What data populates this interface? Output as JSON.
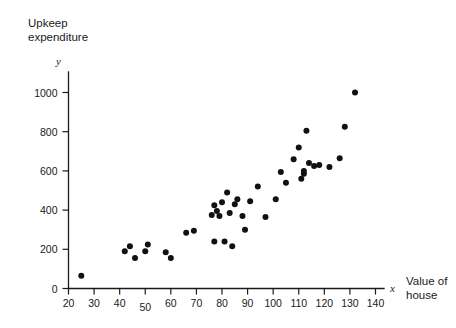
{
  "chart_data": {
    "type": "scatter",
    "title": "",
    "ylabel": "Upkeep expenditure",
    "ylabel_lines": [
      "Upkeep",
      "expenditure"
    ],
    "xlabel": "Value of house",
    "xlabel_lines": [
      "Value of",
      "house"
    ],
    "x_var_symbol": "x",
    "y_var_symbol": "y",
    "xlim": [
      20,
      145
    ],
    "ylim": [
      0,
      1060
    ],
    "x_ticks": [
      20,
      30,
      40,
      50,
      60,
      70,
      80,
      90,
      100,
      110,
      120,
      130,
      140
    ],
    "y_ticks": [
      0,
      200,
      400,
      600,
      800,
      1000
    ],
    "grid": false,
    "legend": null,
    "marker": "filled-circle",
    "marker_color": "#111111",
    "marker_radius": 3.0,
    "n_points": 45,
    "points": [
      {
        "x": 25,
        "y": 65
      },
      {
        "x": 42,
        "y": 190
      },
      {
        "x": 44,
        "y": 215
      },
      {
        "x": 46,
        "y": 155
      },
      {
        "x": 50,
        "y": 190
      },
      {
        "x": 51,
        "y": 225
      },
      {
        "x": 58,
        "y": 185
      },
      {
        "x": 60,
        "y": 155
      },
      {
        "x": 66,
        "y": 285
      },
      {
        "x": 69,
        "y": 295
      },
      {
        "x": 76,
        "y": 375
      },
      {
        "x": 77,
        "y": 425
      },
      {
        "x": 77,
        "y": 240
      },
      {
        "x": 78,
        "y": 395
      },
      {
        "x": 79,
        "y": 370
      },
      {
        "x": 80,
        "y": 440
      },
      {
        "x": 81,
        "y": 240
      },
      {
        "x": 82,
        "y": 490
      },
      {
        "x": 83,
        "y": 385
      },
      {
        "x": 84,
        "y": 215
      },
      {
        "x": 85,
        "y": 430
      },
      {
        "x": 86,
        "y": 455
      },
      {
        "x": 88,
        "y": 370
      },
      {
        "x": 89,
        "y": 300
      },
      {
        "x": 91,
        "y": 445
      },
      {
        "x": 94,
        "y": 520
      },
      {
        "x": 97,
        "y": 365
      },
      {
        "x": 101,
        "y": 455
      },
      {
        "x": 103,
        "y": 595
      },
      {
        "x": 105,
        "y": 540
      },
      {
        "x": 108,
        "y": 660
      },
      {
        "x": 110,
        "y": 720
      },
      {
        "x": 111,
        "y": 560
      },
      {
        "x": 112,
        "y": 585
      },
      {
        "x": 112,
        "y": 600
      },
      {
        "x": 113,
        "y": 805
      },
      {
        "x": 114,
        "y": 640
      },
      {
        "x": 116,
        "y": 625
      },
      {
        "x": 118,
        "y": 630
      },
      {
        "x": 122,
        "y": 620
      },
      {
        "x": 126,
        "y": 665
      },
      {
        "x": 128,
        "y": 825
      },
      {
        "x": 132,
        "y": 1000
      }
    ]
  },
  "axis_labels": {
    "x_tick_texts": [
      "20",
      "30",
      "40",
      "50",
      "60",
      "70",
      "80",
      "90",
      "100",
      "110",
      "120",
      "130",
      "140"
    ],
    "y_tick_texts": [
      "0",
      "200",
      "400",
      "600",
      "800",
      "1000"
    ]
  }
}
